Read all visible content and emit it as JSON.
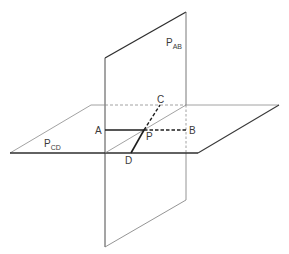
{
  "diagram": {
    "colors": {
      "background": "#ffffff",
      "thick_line": "#2e2e2e",
      "thin_line": "#7a7a7a",
      "label": "#3a3a3a"
    },
    "planes": [
      {
        "id": "P_AB",
        "label_main": "P",
        "label_sub": "AB",
        "orientation": "vertical",
        "label_pos": [
          166,
          46
        ]
      },
      {
        "id": "P_CD",
        "label_main": "P",
        "label_sub": "CD",
        "orientation": "horizontal",
        "label_pos": [
          44,
          147
        ]
      }
    ],
    "points": [
      {
        "id": "A",
        "label": "A",
        "x": 105,
        "y": 130,
        "label_pos": [
          93,
          134
        ]
      },
      {
        "id": "B",
        "label": "B",
        "x": 186,
        "y": 130,
        "label_pos": [
          189,
          134
        ]
      },
      {
        "id": "C",
        "label": "C",
        "x": 160,
        "y": 105,
        "label_pos": [
          157,
          103
        ]
      },
      {
        "id": "D",
        "label": "D",
        "x": 131,
        "y": 153,
        "label_pos": [
          126,
          164
        ]
      },
      {
        "id": "P",
        "label": "P",
        "x": 144,
        "y": 130,
        "label_pos": [
          146,
          140
        ]
      }
    ],
    "segments": [
      {
        "from": "A",
        "to": "P",
        "style": "solid-thick"
      },
      {
        "from": "P",
        "to": "B",
        "style": "dashed-thick"
      },
      {
        "from": "D",
        "to": "P",
        "style": "solid-thick"
      },
      {
        "from": "P",
        "to": "C",
        "style": "dashed-thick"
      }
    ]
  }
}
